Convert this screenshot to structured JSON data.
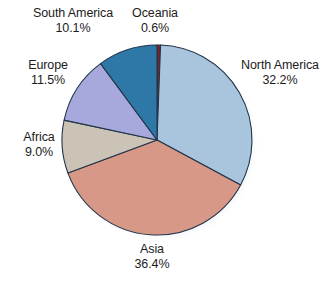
{
  "chart_data": {
    "type": "pie",
    "title": "",
    "subtitle": "",
    "xlabel": "",
    "ylabel": "",
    "legend_position": "callout-labels",
    "grid": false,
    "unit": "%",
    "start_angle_deg": 0,
    "direction": "clockwise",
    "categories": [
      "Oceania",
      "North America",
      "Asia",
      "Africa",
      "Europe",
      "South America"
    ],
    "values": [
      0.6,
      32.2,
      36.4,
      9.0,
      11.5,
      10.1
    ],
    "slices": [
      {
        "name": "oceania",
        "label": "Oceania",
        "value": 0.6,
        "value_label": "0.6%",
        "color": "#7d2420",
        "start_pct": 0.0,
        "end_pct": 0.6
      },
      {
        "name": "north-america",
        "label": "North America",
        "value": 32.2,
        "value_label": "32.2%",
        "color": "#a9c5de",
        "start_pct": 0.6,
        "end_pct": 32.8
      },
      {
        "name": "asia",
        "label": "Asia",
        "value": 36.4,
        "value_label": "36.4%",
        "color": "#d79887",
        "start_pct": 32.8,
        "end_pct": 69.2
      },
      {
        "name": "africa",
        "label": "Africa",
        "value": 9.0,
        "value_label": "9.0%",
        "color": "#cbc4b6",
        "start_pct": 69.2,
        "end_pct": 78.2
      },
      {
        "name": "europe",
        "label": "Europe",
        "value": 11.5,
        "value_label": "11.5%",
        "color": "#a7a9dd",
        "start_pct": 78.2,
        "end_pct": 89.7
      },
      {
        "name": "south-america",
        "label": "South America",
        "value": 10.1,
        "value_label": "10.1%",
        "color": "#2e78a8",
        "start_pct": 89.7,
        "end_pct": 99.8
      }
    ],
    "colors": {
      "oceania": "#7d2420",
      "north_america": "#a9c5de",
      "asia": "#d79887",
      "africa": "#cbc4b6",
      "europe": "#a7a9dd",
      "south_america": "#2e78a8",
      "outline": "#23354a",
      "background": "#ffffff",
      "text": "#1c1c1c"
    }
  },
  "callouts": {
    "south_america": {
      "label": "South America",
      "value_label": "10.1%"
    },
    "oceania": {
      "label": "Oceania",
      "value_label": "0.6%"
    },
    "north_america": {
      "label": "North America",
      "value_label": "32.2%"
    },
    "europe": {
      "label": "Europe",
      "value_label": "11.5%"
    },
    "africa": {
      "label": "Africa",
      "value_label": "9.0%"
    },
    "asia": {
      "label": "Asia",
      "value_label": "36.4%"
    }
  }
}
